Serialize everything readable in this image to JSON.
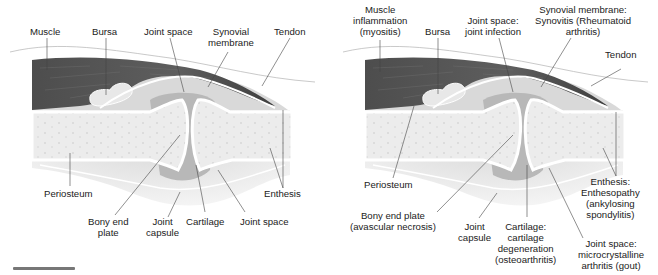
{
  "figure": {
    "left_panel": {
      "title": "Normal joint anatomy",
      "labels": {
        "muscle": "Muscle",
        "bursa": "Bursa",
        "joint_space_top": "Joint space",
        "synovial_membrane": "Synovial\nmembrane",
        "tendon": "Tendon",
        "periosteum": "Periosteum",
        "enthesis": "Enthesis",
        "bony_end_plate": "Bony end\nplate",
        "joint_capsule": "Joint\ncapsule",
        "cartilage": "Cartilage",
        "joint_space_bottom": "Joint space"
      }
    },
    "right_panel": {
      "title": "Sites of joint pathology",
      "labels": {
        "muscle": "Muscle\ninflammation\n(myositis)",
        "bursa": "Bursa",
        "joint_space_top": "Joint space:\njoint infection",
        "synovial_membrane": "Synovial membrane:\nSynovitis (Rheumatoid\narthritis)",
        "tendon": "Tendon",
        "periosteum": "Periosteum",
        "enthesis": "Enthesis:\nEnthesopathy\n(ankylosing\nspondylitis)",
        "bony_end_plate": "Bony end plate\n(avascular necrosis)",
        "joint_capsule": "Joint\ncapsule",
        "cartilage": "Cartilage:\ncartilage\ndegeneration\n(osteoarthritis)",
        "joint_space_bottom": "Joint space:\nmicrocrystalline\narthritis (gout)"
      }
    },
    "colors": {
      "muscle": "#5a5a5a",
      "bone": "#ececec",
      "cartilage": "#ffffff",
      "joint_space": "#b8b8b8",
      "capsule": "#d8d8d8",
      "leader_line": "#444444",
      "text": "#222222"
    }
  }
}
